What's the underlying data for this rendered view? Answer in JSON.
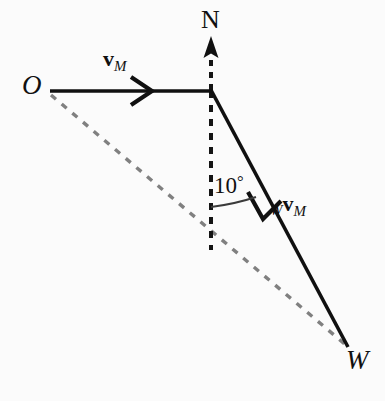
{
  "figure": {
    "background_color": "#fbfbfb",
    "solid_line_color": "#101010",
    "dashed_line_color": "#808080",
    "north_dash_color": "#141414",
    "labels": {
      "origin": "O",
      "north": "N",
      "west": "W",
      "angle": "10",
      "degree_symbol": "°",
      "vector_m": "v",
      "vector_m_subscript": "M",
      "vector_wm_prefix": "W",
      "vector_wm": "v",
      "vector_wm_subscript": "M"
    },
    "geometry": {
      "origin_point": [
        50,
        91
      ],
      "corner_point": [
        211,
        91
      ],
      "west_point": [
        348,
        347
      ],
      "north_arrow_tip": [
        211,
        37
      ],
      "vertical_dash_end": [
        211,
        250
      ],
      "angle_degrees": 10,
      "arc_start": [
        211,
        207
      ],
      "arc_end": [
        256,
        197
      ]
    }
  }
}
